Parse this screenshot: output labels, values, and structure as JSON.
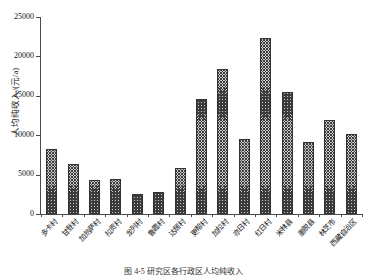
{
  "chart_data": {
    "type": "bar",
    "title": "",
    "xlabel": "",
    "ylabel": "人均纯收入/(元/a)",
    "ylim": [
      0,
      25000
    ],
    "ytick_values": [
      0,
      5000,
      10000,
      15000,
      20000,
      25000
    ],
    "ytick_labels": [
      "0",
      "5000",
      "10000",
      "15000",
      "20000",
      "25000"
    ],
    "grid": false,
    "legend": "none",
    "categories": [
      "多卡村",
      "甘登村",
      "加热萨村",
      "拉贡村",
      "龙列村",
      "鲁霞村",
      "达居村",
      "更帮村",
      "加拉村",
      "亦日村",
      "红日村",
      "米林县",
      "墨脱县",
      "林芝市",
      "西藏自治区"
    ],
    "values": [
      8300,
      6400,
      4300,
      4450,
      2500,
      2800,
      5900,
      14600,
      18400,
      9500,
      22300,
      15500,
      9100,
      11900,
      10100
    ]
  },
  "figure": {
    "caption": "图 4-5  研究区各行政区人均纯收入"
  },
  "axes": {
    "y_axis_name": "y-axis",
    "x_axis_name": "x-axis"
  }
}
